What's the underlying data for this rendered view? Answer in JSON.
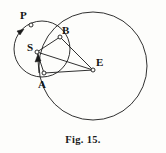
{
  "figure": {
    "caption": "Fig. 15.",
    "background_color": "#fdfdfb",
    "ink_color": "#1a1a1a",
    "labels": [
      {
        "id": "P",
        "text": "P",
        "x": 20,
        "y": 10
      },
      {
        "id": "B",
        "text": "B",
        "x": 62,
        "y": 25
      },
      {
        "id": "S",
        "text": "S",
        "x": 27,
        "y": 42
      },
      {
        "id": "A",
        "text": "A",
        "x": 38,
        "y": 79
      },
      {
        "id": "E",
        "text": "E",
        "x": 96,
        "y": 57
      }
    ],
    "points": [
      {
        "id": "P",
        "x": 31,
        "y": 25,
        "marker": "open-circle"
      },
      {
        "id": "B",
        "x": 60,
        "y": 37,
        "marker": "open-circle"
      },
      {
        "id": "S",
        "x": 37,
        "y": 52,
        "marker": "open-circle"
      },
      {
        "id": "A",
        "x": 44,
        "y": 73,
        "marker": "open-circle"
      },
      {
        "id": "E",
        "x": 93,
        "y": 70,
        "marker": "open-circle"
      }
    ],
    "circles": [
      {
        "id": "large-circle",
        "cx": 93,
        "cy": 66,
        "r": 54
      },
      {
        "id": "small-circle",
        "cx": 42,
        "cy": 49,
        "r": 28
      }
    ],
    "segments": [
      {
        "id": "segment-S-B",
        "from": "S",
        "to": "B"
      },
      {
        "id": "segment-S-E",
        "from": "S",
        "to": "E"
      },
      {
        "id": "segment-S-A",
        "from": "S",
        "to": "A"
      },
      {
        "id": "segment-A-E",
        "from": "A",
        "to": "E"
      },
      {
        "id": "segment-B-E",
        "from": "B",
        "to": "E"
      }
    ],
    "arrows": [
      {
        "id": "arrow-at-P",
        "description": "arrowhead on small circle below P pointing down-left"
      },
      {
        "id": "arrow-at-S",
        "description": "arrowhead pointing up toward S along chord"
      }
    ]
  }
}
